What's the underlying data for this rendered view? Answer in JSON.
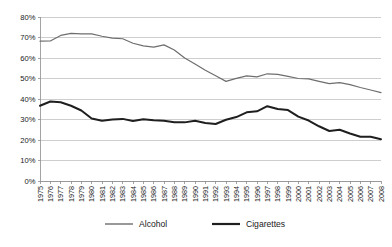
{
  "chart_data": {
    "type": "line",
    "title": "",
    "subtitle": "",
    "xlabel": "",
    "ylabel": "",
    "ylim": [
      0,
      80
    ],
    "ytick_labels": [
      "0%",
      "10%",
      "20%",
      "30%",
      "40%",
      "50%",
      "60%",
      "70%",
      "80%"
    ],
    "ytick_values": [
      0,
      10,
      20,
      30,
      40,
      50,
      60,
      70,
      80
    ],
    "grid": true,
    "legend_position": "bottom",
    "categories": [
      "1975",
      "1976",
      "1977",
      "1978",
      "1979",
      "1980",
      "1981",
      "1982",
      "1983",
      "1984",
      "1985",
      "1986",
      "1987",
      "1988",
      "1989",
      "1990",
      "1991",
      "1992",
      "1993",
      "1994",
      "1995",
      "1996",
      "1997",
      "1998",
      "1999",
      "2000",
      "2001",
      "2002",
      "2003",
      "2004",
      "2005",
      "2006",
      "2007",
      "2008"
    ],
    "series": [
      {
        "name": "Alcohol",
        "color": "#6e6e6e",
        "width": 1.2,
        "values": [
          68.2,
          68.3,
          71.0,
          72.0,
          71.8,
          71.8,
          70.6,
          69.7,
          69.4,
          67.2,
          65.9,
          65.3,
          66.4,
          63.9,
          60.0,
          57.1,
          54.0,
          51.3,
          48.6,
          50.1,
          51.3,
          50.8,
          52.3,
          52.0,
          51.0,
          50.0,
          49.8,
          48.6,
          47.5,
          48.0,
          47.0,
          45.6,
          44.4,
          43.1
        ]
      },
      {
        "name": "Cigarettes",
        "color": "#1f1f1f",
        "width": 2.0,
        "values": [
          36.7,
          38.8,
          38.4,
          36.7,
          34.4,
          30.5,
          29.4,
          30.0,
          30.3,
          29.3,
          30.1,
          29.6,
          29.4,
          28.7,
          28.6,
          29.4,
          28.3,
          27.8,
          29.9,
          31.2,
          33.5,
          34.0,
          36.5,
          35.1,
          34.6,
          31.4,
          29.5,
          26.7,
          24.4,
          25.0,
          23.2,
          21.6,
          21.6,
          20.4
        ]
      }
    ]
  },
  "legend": {
    "items": [
      {
        "label": "Alcohol"
      },
      {
        "label": "Cigarettes"
      }
    ]
  }
}
